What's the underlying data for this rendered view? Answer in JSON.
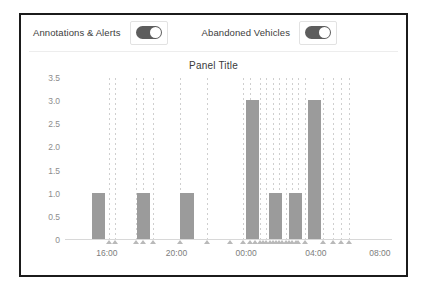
{
  "controls": [
    {
      "label": "Annotations & Alerts",
      "name": "annotations-alerts",
      "state": "on"
    },
    {
      "label": "Abandoned Vehicles",
      "name": "abandoned-vehicles",
      "state": "on"
    }
  ],
  "panel": {
    "title": "Panel Title"
  },
  "colors": {
    "bar": "#9b9b9b",
    "gridline": "#cfcfcf",
    "marker": "#b9b9b9",
    "frame": "#1b1b1b",
    "axis_text": "#7d7d7d"
  },
  "chart_data": {
    "type": "bar",
    "title": "Panel Title",
    "xlabel": "",
    "ylabel": "",
    "ylim": [
      0,
      3.5
    ],
    "yticks": [
      "0",
      "0.5",
      "1.0",
      "1.5",
      "2.0",
      "2.5",
      "3.0",
      "3.5"
    ],
    "ytick_values": [
      0,
      0.5,
      1.0,
      1.5,
      2.0,
      2.5,
      3.0,
      3.5
    ],
    "xticks": [
      "16:00",
      "20:00",
      "00:00",
      "04:00",
      "08:00"
    ],
    "xtick_positions": [
      0.128,
      0.341,
      0.554,
      0.767,
      0.963
    ],
    "grid": false,
    "legend": "none",
    "bars": [
      {
        "x": 0.082,
        "value": 1.0
      },
      {
        "x": 0.22,
        "value": 1.0
      },
      {
        "x": 0.353,
        "value": 1.0
      },
      {
        "x": 0.553,
        "value": 3.0
      },
      {
        "x": 0.625,
        "value": 1.0
      },
      {
        "x": 0.684,
        "value": 1.0
      },
      {
        "x": 0.742,
        "value": 3.0
      }
    ],
    "bar_width_frac": 0.04,
    "annotation_lines": [
      0.134,
      0.154,
      0.218,
      0.238,
      0.27,
      0.352,
      0.433,
      0.545,
      0.565,
      0.596,
      0.616,
      0.636,
      0.655,
      0.675,
      0.695,
      0.714,
      0.734,
      0.79,
      0.82,
      0.845,
      0.868
    ],
    "annotation_markers": [
      0.134,
      0.154,
      0.218,
      0.238,
      0.27,
      0.352,
      0.433,
      0.505,
      0.545,
      0.565,
      0.58,
      0.596,
      0.606,
      0.616,
      0.626,
      0.636,
      0.646,
      0.655,
      0.665,
      0.675,
      0.685,
      0.695,
      0.705,
      0.714,
      0.734,
      0.79,
      0.82,
      0.845,
      0.868
    ]
  }
}
